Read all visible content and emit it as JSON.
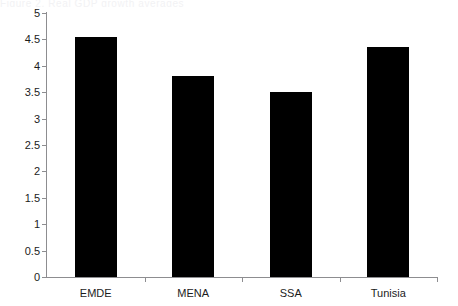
{
  "artifact": {
    "top_clipped_text": "Figure 2. Real GDP growth averages"
  },
  "chart_data": {
    "type": "bar",
    "title": "",
    "subtitle": "",
    "xlabel": "",
    "ylabel": "",
    "categories": [
      "EMDE",
      "MENA",
      "SSA",
      "Tunisia"
    ],
    "values": [
      4.55,
      3.81,
      3.5,
      4.35
    ],
    "series": [
      {
        "name": "",
        "values": [
          4.55,
          3.81,
          3.5,
          4.35
        ],
        "color": "#000000"
      }
    ],
    "ylim": [
      0,
      5
    ],
    "ytick_values": [
      0,
      0.5,
      1,
      1.5,
      2,
      2.5,
      3,
      3.5,
      4,
      4.5,
      5
    ],
    "ytick_labels": [
      "0",
      "0.5",
      "1",
      "1.5",
      "2",
      "2.5",
      "3",
      "3.5",
      "4",
      "4.5",
      "5"
    ],
    "grid": false,
    "legend": null,
    "legend_position": "none",
    "annotations": [],
    "bar_color": "#000000",
    "axis_color": "#8d8d90",
    "background_color": "#ffffff"
  }
}
